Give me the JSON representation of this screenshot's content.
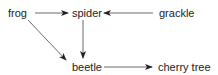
{
  "diagram": {
    "type": "food-web",
    "nodes": {
      "frog": {
        "label": "frog",
        "x": 8,
        "y": 7
      },
      "spider": {
        "label": "spider",
        "x": 72,
        "y": 7
      },
      "grackle": {
        "label": "grackle",
        "x": 159,
        "y": 7
      },
      "beetle": {
        "label": "beetle",
        "x": 72,
        "y": 61
      },
      "cherry_tree": {
        "label": "cherry tree",
        "x": 158,
        "y": 61
      }
    },
    "edges": [
      {
        "from": "frog",
        "to": "spider"
      },
      {
        "from": "grackle",
        "to": "spider"
      },
      {
        "from": "spider",
        "to": "beetle"
      },
      {
        "from": "frog",
        "to": "beetle"
      },
      {
        "from": "beetle",
        "to": "cherry tree"
      }
    ],
    "colors": {
      "line": "#333333",
      "text": "#222222",
      "background": "#ffffff"
    }
  }
}
